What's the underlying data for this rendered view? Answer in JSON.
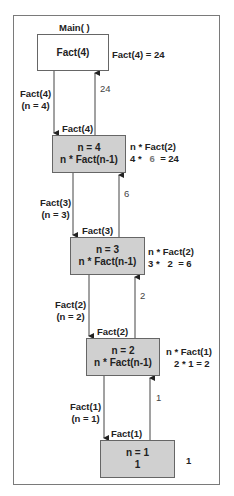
{
  "title": "Main( )",
  "main_box": {
    "label": "Fact(4)",
    "result": "Fact(4) = 24"
  },
  "calls": [
    {
      "call": "Fact(4)",
      "param": "(n = 4)",
      "box_label": "Fact(4)",
      "box_line1": "n = 4",
      "box_line2": "n * Fact(n-1)",
      "return_value": "24",
      "expr_line1": "n * Fact(2)",
      "expr_a": "4 *",
      "expr_b": "6",
      "expr_c": "= 24"
    },
    {
      "call": "Fact(3)",
      "param": "(n = 3)",
      "box_label": "Fact(3)",
      "box_line1": "n = 3",
      "box_line2": "n * Fact(n-1)",
      "return_value": "6",
      "expr_line1": "n * Fact(2)",
      "expr_a": "3 *",
      "expr_b": "2",
      "expr_c": "= 6"
    },
    {
      "call": "Fact(2)",
      "param": "(n = 2)",
      "box_label": "Fact(2)",
      "box_line1": "n = 2",
      "box_line2": "n * Fact(n-1)",
      "return_value": "2",
      "expr_line1": "n * Fact(1)",
      "expr_a": "2 * 1 = 2",
      "expr_b": "",
      "expr_c": ""
    },
    {
      "call": "Fact(1)",
      "param": "(n = 1)",
      "box_label": "Fact(1)",
      "box_line1": "n = 1",
      "box_line2": "1",
      "return_value": "1",
      "expr_line1": "1",
      "expr_a": "",
      "expr_b": "",
      "expr_c": ""
    }
  ]
}
